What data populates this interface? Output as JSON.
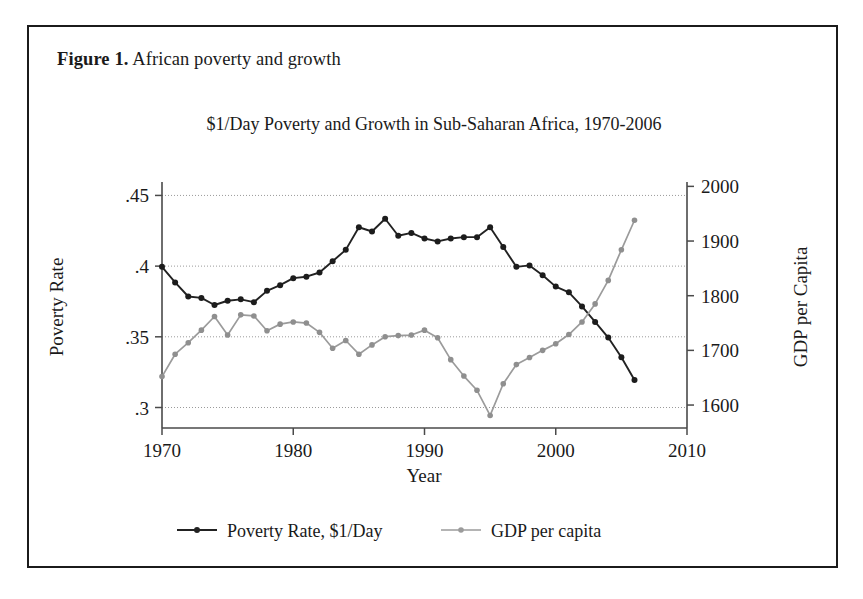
{
  "figure": {
    "caption_label": "Figure 1.",
    "caption_text": " African poverty and growth"
  },
  "colors": {
    "poverty_series": "#222222",
    "gdp_series": "#9b9b9b",
    "frame": "#1b1b1b",
    "grid": "#9a9a9a",
    "axis": "#4a4a4a"
  },
  "chart_data": {
    "type": "line",
    "title": "$1/Day Poverty and Growth in Sub-Saharan Africa, 1970-2006",
    "xlabel": "Year",
    "ylabel": "Poverty Rate",
    "y2label": "GDP per Capita",
    "xlim": [
      1970,
      2010
    ],
    "xticks": [
      1970,
      1980,
      1990,
      2000,
      2010
    ],
    "xticklabels": [
      "1970",
      "1980",
      "1990",
      "2000",
      "2010"
    ],
    "ylim": [
      0.2855,
      0.4595
    ],
    "yticks": [
      0.3,
      0.35,
      0.4,
      0.45
    ],
    "yticklabels": [
      ".3",
      ".35",
      ".4",
      ".45"
    ],
    "y2lim": [
      1558,
      2008
    ],
    "y2ticks": [
      1600,
      1700,
      1800,
      1900,
      2000
    ],
    "y2ticklabels": [
      "1600",
      "1700",
      "1800",
      "1900",
      "2000"
    ],
    "grid": true,
    "legend_position": "below",
    "x": [
      1970,
      1971,
      1972,
      1973,
      1974,
      1975,
      1976,
      1977,
      1978,
      1979,
      1980,
      1981,
      1982,
      1983,
      1984,
      1985,
      1986,
      1987,
      1988,
      1989,
      1990,
      1991,
      1992,
      1993,
      1994,
      1995,
      1996,
      1997,
      1998,
      1999,
      2000,
      2001,
      2002,
      2003,
      2004,
      2005,
      2006
    ],
    "series": [
      {
        "name": "Poverty Rate, $1/Day",
        "axis": "left",
        "color": "#222222",
        "values": [
          0.3995,
          0.3885,
          0.3785,
          0.3775,
          0.3725,
          0.3755,
          0.3765,
          0.3745,
          0.3825,
          0.3865,
          0.3915,
          0.3925,
          0.3955,
          0.4035,
          0.4115,
          0.4275,
          0.4245,
          0.4335,
          0.4215,
          0.4235,
          0.4195,
          0.4175,
          0.4195,
          0.4205,
          0.4205,
          0.4275,
          0.4135,
          0.3995,
          0.4005,
          0.3935,
          0.3855,
          0.3815,
          0.3715,
          0.3605,
          0.3495,
          0.3355,
          0.3195
        ]
      },
      {
        "name": "GDP per capita",
        "axis": "right",
        "color": "#9b9b9b",
        "values": [
          1652,
          1693,
          1714,
          1737,
          1762,
          1728,
          1765,
          1763,
          1736,
          1748,
          1752,
          1750,
          1733,
          1704,
          1718,
          1693,
          1710,
          1725,
          1727,
          1728,
          1737,
          1723,
          1683,
          1653,
          1627,
          1581,
          1639,
          1674,
          1687,
          1700,
          1712,
          1729,
          1752,
          1785,
          1828,
          1884,
          1938
        ]
      }
    ],
    "legend": [
      {
        "label": "Poverty Rate, $1/Day",
        "color": "#222222"
      },
      {
        "label": "GDP per capita",
        "color": "#9b9b9b"
      }
    ]
  }
}
